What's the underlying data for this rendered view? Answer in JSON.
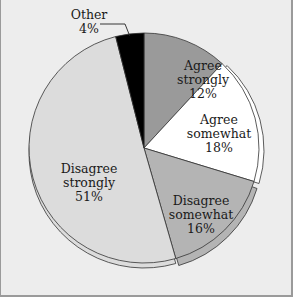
{
  "chart_data": {
    "type": "pie",
    "title": "",
    "categories": [
      "Agree strongly",
      "Agree somewhat",
      "Disagree somewhat",
      "Disagree strongly",
      "Other"
    ],
    "values": [
      12,
      18,
      16,
      51,
      4
    ],
    "unit": "%",
    "colors": [
      "#9a9a9a",
      "#ffffff",
      "#b4b4b4",
      "#dcdcdc",
      "#000000"
    ],
    "start_angle_deg": 0,
    "direction": "clockwise",
    "legend": "none (direct labels)",
    "labels": [
      {
        "line1": "Agree",
        "line2": "strongly",
        "pct": "12%"
      },
      {
        "line1": "Agree",
        "line2": "somewhat",
        "pct": "18%"
      },
      {
        "line1": "Disagree",
        "line2": "somewhat",
        "pct": "16%"
      },
      {
        "line1": "Disagree",
        "line2": "strongly",
        "pct": "51%"
      },
      {
        "line1": "Other",
        "line2": "",
        "pct": "4%"
      }
    ]
  }
}
